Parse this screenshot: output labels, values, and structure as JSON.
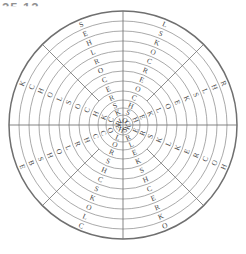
{
  "page": {
    "background_color": "#ffffff",
    "corner_fragment_text": "25 12"
  },
  "figure": {
    "name": "circular-letter-wheel",
    "center_x": 123,
    "center_y": 125,
    "outer_radius": 114,
    "ring_count": 12,
    "sector_count": 8,
    "outer_ring_color": "#6f6f6f",
    "inner_ring_color": "#8e8e8e",
    "spoke_color": "#6f6f6f",
    "letter_color": "#4a4a4a"
  },
  "chart_data": {
    "type": "heatmap",
    "title": "",
    "subtitle": "",
    "xlabel": "",
    "ylabel": "",
    "grid": true,
    "legend": "none",
    "radii": [
      114,
      104,
      94,
      84,
      74,
      64,
      54,
      44,
      34,
      25,
      17,
      10
    ],
    "sector_angles_deg": [
      270,
      315,
      0,
      45,
      90,
      135,
      180,
      225
    ],
    "sector_names": [
      "north-left",
      "north-right",
      "east-upper",
      "east-lower",
      "south-right",
      "south-left",
      "west-lower",
      "west-upper"
    ],
    "rings": [
      {
        "index": 1,
        "letters": [
          "L",
          "R",
          "H",
          "O",
          "C",
          "E",
          "K",
          "S"
        ]
      },
      {
        "index": 2,
        "letters": [
          "S",
          "H",
          "O",
          "K",
          "L",
          "B",
          "C",
          "E"
        ]
      },
      {
        "index": 3,
        "letters": [
          "K",
          "L",
          "C",
          "R",
          "O",
          "S",
          "H",
          "H"
        ]
      },
      {
        "index": 4,
        "letters": [
          "O",
          "S",
          "R",
          "E",
          "K",
          "H",
          "O",
          "L"
        ]
      },
      {
        "index": 5,
        "letters": [
          "C",
          "K",
          "E",
          "C",
          "S",
          "O",
          "L",
          "R"
        ]
      },
      {
        "index": 6,
        "letters": [
          "R",
          "E",
          "K",
          "H",
          "C",
          "L",
          "S",
          "O"
        ]
      },
      {
        "index": 7,
        "letters": [
          "E",
          "O",
          "L",
          "S",
          "H",
          "R",
          "O",
          "C"
        ]
      },
      {
        "index": 8,
        "letters": [
          "O",
          "L",
          "K",
          "K",
          "S",
          "H",
          "C",
          "E"
        ]
      },
      {
        "index": 9,
        "letters": [
          "C",
          "K",
          "S",
          "E",
          "R",
          "C",
          "H",
          "R"
        ]
      },
      {
        "index": 10,
        "letters": [
          "H",
          "E",
          "R",
          "L",
          "O",
          "C",
          "K",
          "S"
        ]
      },
      {
        "index": 11,
        "letters": [
          "S",
          "H",
          "E",
          "R",
          "L",
          "O",
          "C",
          "K"
        ]
      },
      {
        "index": 12,
        "letters": [
          "O",
          "C",
          "K",
          "S",
          "H",
          "E",
          "R",
          "L"
        ]
      }
    ]
  }
}
